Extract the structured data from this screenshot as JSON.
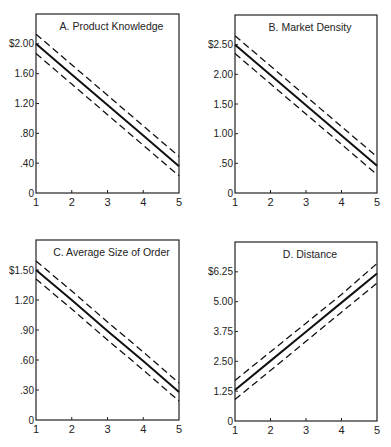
{
  "chart_data": [
    {
      "type": "line",
      "title": "A.  Product Knowledge",
      "xlabel": "",
      "ylabel": "",
      "x": [
        1,
        2,
        3,
        4,
        5
      ],
      "x_ticks": [
        "1",
        "2",
        "3",
        "4",
        "5"
      ],
      "y_ticks": [
        "0",
        ".40",
        ".80",
        "1.20",
        "1.60",
        "$2.00"
      ],
      "y_tick_values": [
        0,
        0.4,
        0.8,
        1.2,
        1.6,
        2.0
      ],
      "ylim": [
        0,
        2.4
      ],
      "grid": false,
      "series": [
        {
          "name": "upper bound",
          "style": "dashed",
          "values": [
            2.13,
            1.72,
            1.31,
            0.9,
            0.49
          ]
        },
        {
          "name": "estimate",
          "style": "solid",
          "values": [
            2.0,
            1.59,
            1.18,
            0.77,
            0.36
          ]
        },
        {
          "name": "lower bound",
          "style": "dashed",
          "values": [
            1.87,
            1.46,
            1.05,
            0.64,
            0.23
          ]
        }
      ]
    },
    {
      "type": "line",
      "title": "B.  Market Density",
      "xlabel": "",
      "ylabel": "",
      "x": [
        1,
        2,
        3,
        4,
        5
      ],
      "x_ticks": [
        "1",
        "2",
        "3",
        "4",
        "5"
      ],
      "y_ticks": [
        "0",
        ".50",
        "1.00",
        "1.50",
        "2.00",
        "$2.50"
      ],
      "y_tick_values": [
        0,
        0.5,
        1.0,
        1.5,
        2.0,
        2.5
      ],
      "ylim": [
        0,
        3.0
      ],
      "grid": false,
      "series": [
        {
          "name": "upper bound",
          "style": "dashed",
          "values": [
            2.65,
            2.14,
            1.63,
            1.12,
            0.61
          ]
        },
        {
          "name": "estimate",
          "style": "solid",
          "values": [
            2.5,
            1.99,
            1.48,
            0.97,
            0.46
          ]
        },
        {
          "name": "lower bound",
          "style": "dashed",
          "values": [
            2.35,
            1.84,
            1.33,
            0.82,
            0.31
          ]
        }
      ]
    },
    {
      "type": "line",
      "title": "C.  Average Size of Order",
      "xlabel": "",
      "ylabel": "",
      "x": [
        1,
        2,
        3,
        4,
        5
      ],
      "x_ticks": [
        "1",
        "2",
        "3",
        "4",
        "5"
      ],
      "y_ticks": [
        "0",
        ".30",
        ".60",
        ".90",
        "1.20",
        "$1.50"
      ],
      "y_tick_values": [
        0,
        0.3,
        0.6,
        0.9,
        1.2,
        1.5
      ],
      "ylim": [
        0,
        1.8
      ],
      "grid": false,
      "series": [
        {
          "name": "upper bound",
          "style": "dashed",
          "values": [
            1.59,
            1.29,
            0.98,
            0.68,
            0.37
          ]
        },
        {
          "name": "estimate",
          "style": "solid",
          "values": [
            1.5,
            1.2,
            0.89,
            0.59,
            0.28
          ]
        },
        {
          "name": "lower bound",
          "style": "dashed",
          "values": [
            1.41,
            1.11,
            0.8,
            0.5,
            0.19
          ]
        }
      ]
    },
    {
      "type": "line",
      "title": "D.  Distance",
      "xlabel": "",
      "ylabel": "",
      "x": [
        1,
        2,
        3,
        4,
        5
      ],
      "x_ticks": [
        "1",
        "2",
        "3",
        "4",
        "5"
      ],
      "y_ticks": [
        "0",
        "1.25",
        "2.50",
        "3.75",
        "5.00",
        "$6.25"
      ],
      "y_tick_values": [
        0,
        1.25,
        2.5,
        3.75,
        5.0,
        6.25
      ],
      "ylim": [
        0,
        7.5
      ],
      "grid": false,
      "series": [
        {
          "name": "upper bound",
          "style": "dashed",
          "values": [
            1.7,
            2.9,
            4.1,
            5.3,
            6.6
          ]
        },
        {
          "name": "estimate",
          "style": "solid",
          "values": [
            1.3,
            2.52,
            3.74,
            4.96,
            6.18
          ]
        },
        {
          "name": "lower bound",
          "style": "dashed",
          "values": [
            0.9,
            2.12,
            3.34,
            4.56,
            5.78
          ]
        }
      ]
    }
  ],
  "panels": [
    {
      "title": "A.  Product Knowledge",
      "frame": {
        "left": 36,
        "right": 179,
        "top": 14,
        "bottom": 193
      },
      "ymax_px_value": 2.4
    },
    {
      "title": "B.  Market Density",
      "frame": {
        "left": 235,
        "right": 377,
        "top": 15,
        "bottom": 193
      },
      "ymax_px_value": 3.0
    },
    {
      "title": "C.  Average Size of Order",
      "frame": {
        "left": 36,
        "right": 179,
        "top": 240,
        "bottom": 420
      },
      "ymax_px_value": 1.8
    },
    {
      "title": "D.  Distance",
      "frame": {
        "left": 235,
        "right": 377,
        "top": 242,
        "bottom": 421
      },
      "ymax_px_value": 7.5
    }
  ]
}
